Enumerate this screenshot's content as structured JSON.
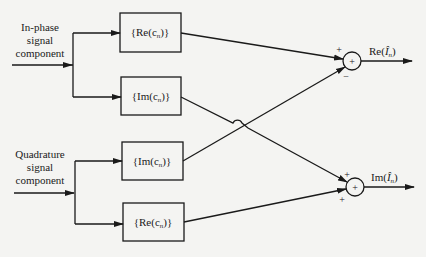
{
  "inputs": {
    "in_phase": {
      "lines": [
        "In-phase",
        "signal",
        "component"
      ]
    },
    "quadrature": {
      "lines": [
        "Quadrature",
        "signal",
        "component"
      ]
    }
  },
  "blocks": [
    {
      "id": "b1",
      "func": "Re",
      "text": "{Re(c",
      "sub": "n",
      "close": ")}"
    },
    {
      "id": "b2",
      "func": "Im",
      "text": "{Im(c",
      "sub": "n",
      "close": ")}"
    },
    {
      "id": "b3",
      "func": "Im",
      "text": "{Im(c",
      "sub": "n",
      "close": ")}"
    },
    {
      "id": "b4",
      "func": "Re",
      "text": "{Re(c",
      "sub": "n",
      "close": ")}"
    }
  ],
  "summers": [
    {
      "id": "s1",
      "symbol": "+",
      "top_sign": "+",
      "bottom_sign": "−",
      "output": {
        "prefix": "Re(",
        "var": "Î",
        "sub": "n",
        "suffix": ")"
      }
    },
    {
      "id": "s2",
      "symbol": "+",
      "top_sign": "+",
      "bottom_sign": "+",
      "output": {
        "prefix": "Im(",
        "var": "Î",
        "sub": "n",
        "suffix": ")"
      }
    }
  ]
}
